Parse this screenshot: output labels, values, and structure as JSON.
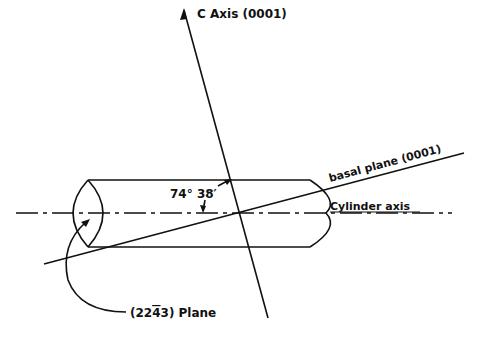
{
  "diagram": {
    "labels": {
      "c_axis": "C  Axis (0001)",
      "angle": "74°  38′",
      "basal_plane": "basal plane (0001)",
      "cylinder_axis": "Cylinder axis",
      "plane": "(22ī3) Plane",
      "plane_prefix": "(22",
      "plane_bar_digit": "4",
      "plane_suffix": "3) Plane"
    },
    "colors": {
      "ink": "#111111",
      "background": "#ffffff"
    }
  }
}
